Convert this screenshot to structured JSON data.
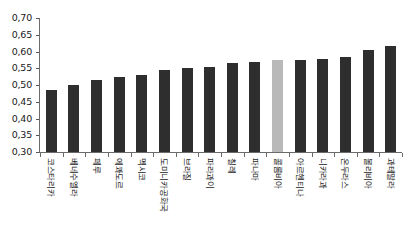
{
  "chart_data": {
    "type": "bar",
    "title": "",
    "xlabel": "",
    "ylabel": "",
    "ylim": [
      0.3,
      0.7
    ],
    "ytick_labels": [
      "0,70",
      "0,65",
      "0,60",
      "0,55",
      "0,50",
      "0,45",
      "0,40",
      "0,35",
      "0,30"
    ],
    "ytick_values": [
      0.7,
      0.65,
      0.6,
      0.55,
      0.5,
      0.45,
      0.4,
      0.35,
      0.3
    ],
    "grid": false,
    "legend": null,
    "decimal_separator": ",",
    "bar_color": "#2e2e2e",
    "highlight_color": "#b9b9b9",
    "highlight_index": 10,
    "categories": [
      "코스타리카",
      "베네수엘라",
      "페루",
      "에콰도르",
      "멕시코",
      "도미니카공화국",
      "브라질",
      "파라과이",
      "칠레",
      "파나마",
      "콜롬비아",
      "아르헨티나",
      "니카라과",
      "온두라스",
      "볼리비아",
      "과테말라"
    ],
    "values": [
      0.485,
      0.5,
      0.515,
      0.525,
      0.53,
      0.545,
      0.55,
      0.555,
      0.565,
      0.57,
      0.575,
      0.575,
      0.578,
      0.585,
      0.605,
      0.615
    ]
  }
}
